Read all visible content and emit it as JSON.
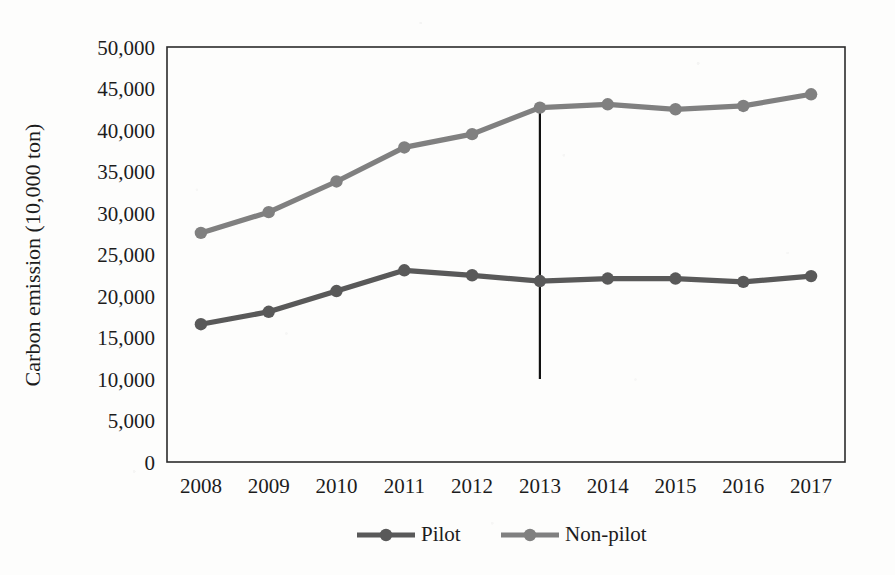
{
  "figure": {
    "background_color": "#fdfdfc",
    "plot_border_color": "#2b2b2b"
  },
  "chart_data": {
    "type": "line",
    "title": "",
    "xlabel": "",
    "ylabel": "Carbon emission (10,000 ton)",
    "categories": [
      "2008",
      "2009",
      "2010",
      "2011",
      "2012",
      "2013",
      "2014",
      "2015",
      "2016",
      "2017"
    ],
    "x": [
      2008,
      2009,
      2010,
      2011,
      2012,
      2013,
      2014,
      2015,
      2016,
      2017
    ],
    "ylim": [
      0,
      50000
    ],
    "xlim": [
      2008,
      2017
    ],
    "ytick_labels": [
      "0",
      "5,000",
      "10,000",
      "15,000",
      "20,000",
      "25,000",
      "30,000",
      "35,000",
      "40,000",
      "45,000",
      "50,000"
    ],
    "ytick_values": [
      0,
      5000,
      10000,
      15000,
      20000,
      25000,
      30000,
      35000,
      40000,
      45000,
      50000
    ],
    "grid": false,
    "legend_position": "bottom-center",
    "series": [
      {
        "name": "Pilot",
        "color": "#595959",
        "marker": "circle",
        "values": [
          16600,
          18100,
          20600,
          23100,
          22500,
          21800,
          22100,
          22100,
          21700,
          22400
        ]
      },
      {
        "name": "Non-pilot",
        "color": "#808080",
        "marker": "circle",
        "values": [
          27600,
          30100,
          33800,
          37900,
          39500,
          42700,
          43100,
          42500,
          42900,
          44300
        ]
      }
    ],
    "annotations": [
      {
        "name": "policy-year-marker",
        "type": "vertical-line",
        "x": 2013,
        "y_from": 42700,
        "y_to": 10000,
        "color": "#111111",
        "label": ""
      }
    ]
  },
  "legend": {
    "items": [
      {
        "label": "Pilot",
        "color": "#595959"
      },
      {
        "label": "Non-pilot",
        "color": "#808080"
      }
    ]
  }
}
